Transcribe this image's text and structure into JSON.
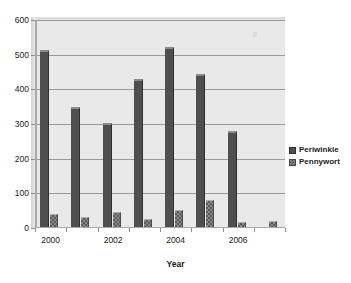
{
  "chart_data": {
    "type": "bar",
    "title": "",
    "xlabel": "Year",
    "ylabel": "",
    "categories": [
      "2000",
      "2001",
      "2002",
      "2003",
      "2004",
      "2005",
      "2006",
      "2007"
    ],
    "visible_tick_labels": [
      "2000",
      "2002",
      "2004",
      "2006"
    ],
    "series": [
      {
        "name": "Periwinkle",
        "color": "#4f4f4f",
        "values": [
          510,
          345,
          300,
          428,
          518,
          440,
          278,
          0
        ]
      },
      {
        "name": "Pennywort",
        "color": "#8a8a8a",
        "values": [
          38,
          30,
          43,
          22,
          50,
          78,
          15,
          18
        ]
      }
    ],
    "ylim": [
      0,
      600
    ],
    "ytick_labels": [
      "0",
      "100",
      "200",
      "300",
      "400",
      "500",
      "600"
    ],
    "ytick_values": [
      0,
      100,
      200,
      300,
      400,
      500,
      600
    ],
    "grid": true,
    "legend_position": "right",
    "plot_background": "#e9e9e9",
    "gridline_color": "#9a9a9a"
  },
  "legend": {
    "entries": [
      {
        "label": "Periwinkle"
      },
      {
        "label": "Pennywort"
      }
    ]
  },
  "axis": {
    "x_title": "Year"
  }
}
